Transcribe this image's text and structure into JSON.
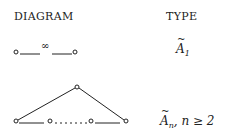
{
  "headers": {
    "diagram": "DIAGRAM",
    "type": "TYPE"
  },
  "rows": [
    {
      "diagram": {
        "nodes": 2,
        "edge_label": "∞"
      },
      "type": {
        "base": "A",
        "tilde": "~",
        "sub": "1",
        "condition": ""
      }
    },
    {
      "diagram": {
        "nodes": "n+1 (cycle)",
        "middle": "....."
      },
      "type": {
        "base": "A",
        "tilde": "~",
        "sub": "n",
        "condition": ", n ≥ 2"
      }
    }
  ]
}
